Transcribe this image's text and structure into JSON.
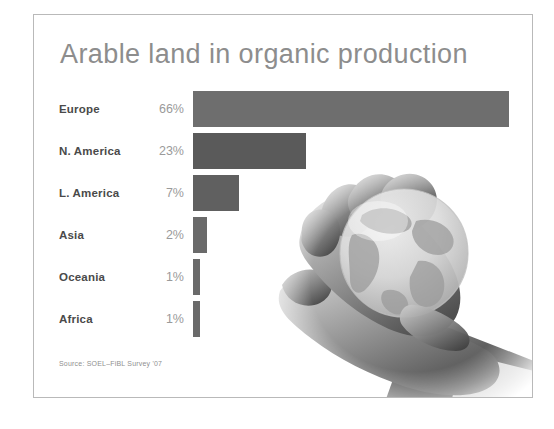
{
  "slide": {
    "title": "Arable land in organic production",
    "source_note": "Source: SOEL–FiBL Survey '07",
    "photo_alt": "hands-holding-globe-photo"
  },
  "chart_data": {
    "type": "bar",
    "orientation": "horizontal",
    "title": "Arable land in organic production",
    "subtitle": "",
    "xlabel": "",
    "ylabel": "",
    "categories": [
      "Europe",
      "N. America",
      "L. America",
      "Asia",
      "Oceania",
      "Africa"
    ],
    "values": [
      66,
      23,
      7,
      2,
      1,
      1
    ],
    "value_labels": [
      "66%",
      "23%",
      "7%",
      "2%",
      "1%",
      "1%"
    ],
    "units": "percent",
    "xlim": [
      0,
      66
    ],
    "grid": false,
    "legend": null,
    "annotations": [
      "Source: SOEL–FiBL Survey '07"
    ],
    "bar_colors": [
      "#6e6e6e",
      "#5a5a5a",
      "#606060",
      "#6a6a6a",
      "#6a6a6a",
      "#6a6a6a"
    ],
    "bars": [
      {
        "category": "Europe",
        "value": 66,
        "label": "66%",
        "color": "#6e6e6e",
        "pixel_width": 316
      },
      {
        "category": "N. America",
        "value": 23,
        "label": "23%",
        "color": "#5a5a5a",
        "pixel_width": 113
      },
      {
        "category": "L. America",
        "value": 7,
        "label": "7%",
        "color": "#606060",
        "pixel_width": 46
      },
      {
        "category": "Asia",
        "value": 2,
        "label": "2%",
        "color": "#6a6a6a",
        "pixel_width": 14
      },
      {
        "category": "Oceania",
        "value": 1,
        "label": "1%",
        "color": "#6a6a6a",
        "pixel_width": 7
      },
      {
        "category": "Africa",
        "value": 1,
        "label": "1%",
        "color": "#6a6a6a",
        "pixel_width": 7
      }
    ]
  },
  "colors": {
    "background": "#ffffff",
    "frame_border": "#b9b9b9",
    "title_text": "#8d8d8d",
    "label_text": "#4a4a4a",
    "value_text": "#9a9a9a",
    "source_text": "#8f8f8f",
    "bar_primary": "#6e6e6e",
    "bar_secondary": "#5a5a5a"
  }
}
